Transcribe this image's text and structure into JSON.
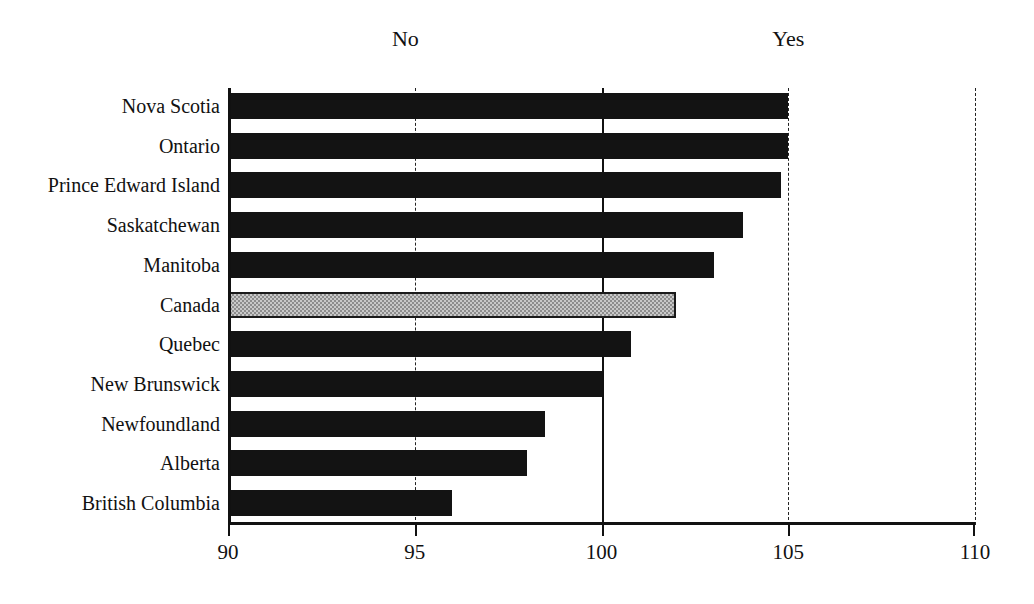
{
  "chart_data": {
    "type": "bar",
    "orientation": "horizontal",
    "title": "",
    "xlabel": "",
    "ylabel": "",
    "xlim": [
      90,
      110
    ],
    "xticks": [
      90,
      95,
      100,
      105,
      110
    ],
    "xtick_labels": [
      "90",
      "95",
      "100",
      "105",
      "110"
    ],
    "grid": true,
    "gridlines": [
      {
        "value": 95,
        "style": "dashed"
      },
      {
        "value": 100,
        "style": "solid"
      },
      {
        "value": 105,
        "style": "dashed"
      },
      {
        "value": 110,
        "style": "dashed"
      }
    ],
    "baseline": 90,
    "annotations": [
      {
        "text": "No",
        "value": 94.75,
        "position": "top"
      },
      {
        "text": "Yes",
        "value": 105.0,
        "position": "top"
      }
    ],
    "legend": null,
    "categories": [
      "Nova Scotia",
      "Ontario",
      "Prince Edward Island",
      "Saskatchewan",
      "Manitoba",
      "Canada",
      "Quebec",
      "New Brunswick",
      "Newfoundland",
      "Alberta",
      "British Columbia"
    ],
    "values": [
      105.0,
      105.0,
      104.8,
      103.8,
      103.0,
      102.0,
      100.8,
      100.0,
      98.5,
      98.0,
      96.0
    ],
    "highlight_category": "Canada",
    "colors": {
      "bar": "#131313",
      "highlight_fill": "#c9c9c9",
      "highlight_hatch": "#8d8d8d",
      "highlight_border": "#1a1a1a",
      "axis": "#111111",
      "background": "#ffffff"
    }
  }
}
